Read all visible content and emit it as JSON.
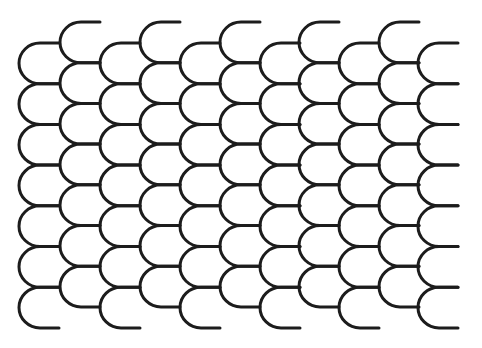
{
  "pattern": {
    "name": "fish-scale-pattern",
    "background": "#ffffff",
    "stroke_color": "#1c1c1c",
    "stroke_width": 3,
    "scale_width": 40,
    "arc_width": 21,
    "row_pitch": 40.7,
    "scales_per_column": 7,
    "columns": [
      {
        "x": 19,
        "top_y": 43
      },
      {
        "x": 60,
        "top_y": 22
      },
      {
        "x": 100,
        "top_y": 43
      },
      {
        "x": 140,
        "top_y": 22
      },
      {
        "x": 180,
        "top_y": 43
      },
      {
        "x": 220,
        "top_y": 22
      },
      {
        "x": 260,
        "top_y": 43
      },
      {
        "x": 299,
        "top_y": 22
      },
      {
        "x": 339,
        "top_y": 43
      },
      {
        "x": 379,
        "top_y": 22
      },
      {
        "x": 418,
        "top_y": 43
      }
    ]
  }
}
